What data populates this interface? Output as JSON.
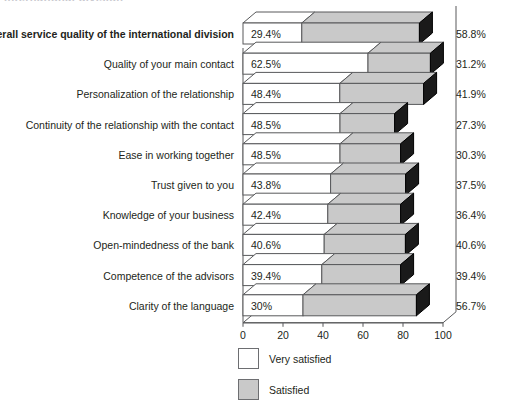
{
  "title_remnant": "international division",
  "legend": {
    "items": [
      {
        "label": "Very satisfied",
        "color": "#ffffff",
        "key": "very_satisfied"
      },
      {
        "label": "Satisfied",
        "color": "#c9c9c9",
        "key": "satisfied"
      }
    ]
  },
  "axis": {
    "ticks": [
      "0",
      "20",
      "40",
      "60",
      "80",
      "100"
    ]
  },
  "chart_data": {
    "type": "bar",
    "orientation": "horizontal",
    "stacked": true,
    "style": "3d",
    "title": "",
    "subtitle": "",
    "xlabel": "",
    "ylabel": "",
    "xlim": [
      0,
      100
    ],
    "xticks": [
      0,
      20,
      40,
      60,
      80,
      100
    ],
    "grid": false,
    "legend_position": "bottom",
    "categories": [
      "Overall service quality of the international division",
      "Quality of your main contact",
      "Personalization of the relationship",
      "Continuity of the relationship with the contact",
      "Ease in working together",
      "Trust given to you",
      "Knowledge of your business",
      "Open-mindedness of the bank",
      "Competence of the advisors",
      "Clarity of the language"
    ],
    "category_emphasis": [
      true,
      false,
      false,
      false,
      false,
      false,
      false,
      false,
      false,
      false
    ],
    "series": [
      {
        "name": "Very satisfied",
        "color": "#ffffff",
        "values": [
          29.4,
          62.5,
          48.4,
          48.5,
          48.5,
          43.8,
          42.4,
          40.6,
          39.4,
          30
        ],
        "labels": [
          "29.4%",
          "62.5%",
          "48.4%",
          "48.5%",
          "48.5%",
          "43.8%",
          "42.4%",
          "40.6%",
          "39.4%",
          "30%"
        ]
      },
      {
        "name": "Satisfied",
        "color": "#c9c9c9",
        "values": [
          58.8,
          31.2,
          41.9,
          27.3,
          30.3,
          37.5,
          36.4,
          40.6,
          39.4,
          56.7
        ],
        "labels": [
          "58.8%",
          "31.2%",
          "41.9%",
          "27.3%",
          "30.3%",
          "37.5%",
          "36.4%",
          "40.6%",
          "39.4%",
          "56.7%"
        ]
      }
    ]
  }
}
